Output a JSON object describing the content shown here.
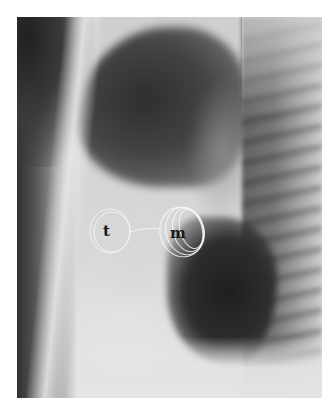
{
  "figure": {
    "labels": {
      "tricuspid": "t",
      "mitral": "m"
    }
  }
}
